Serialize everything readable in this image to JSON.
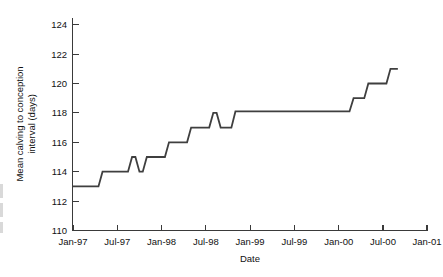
{
  "chart_data": {
    "type": "line",
    "title": "",
    "xlabel": "Date",
    "ylabel": "Mean calving to conception interval (days)",
    "ylabel_line1": "Mean calving to conception",
    "ylabel_line2": "interval (days)",
    "ylim": [
      110,
      124
    ],
    "yticks": [
      110,
      112,
      114,
      116,
      118,
      120,
      122,
      124
    ],
    "ytick_labels": [
      "110",
      "112",
      "114",
      "116",
      "118",
      "120",
      "122",
      "124"
    ],
    "xlim": [
      "Jan-97",
      "Jan-01"
    ],
    "xticks": [
      "Jan-97",
      "Jul-97",
      "Jan-98",
      "Jul-98",
      "Jan-99",
      "Jul-99",
      "Jan-00",
      "Jul-00",
      "Jan-01"
    ],
    "xtick_labels": [
      "Jan-97",
      "Jul-97",
      "Jan-98",
      "Jul-98",
      "Jan-99",
      "Jul-99",
      "Jan-00",
      "Jul-00",
      "Jan-01"
    ],
    "grid": false,
    "legend": null,
    "series": [
      {
        "name": "Mean calving to conception interval",
        "color": "#3f3f3f",
        "x": [
          "Jan-97",
          "Feb-97",
          "Mar-97",
          "Apr-97",
          "May-97",
          "Jun-97",
          "Jul-97",
          "Aug-97",
          "Sep-97",
          "Oct-97",
          "Nov-97",
          "Dec-97",
          "Jan-98",
          "Feb-98",
          "Mar-98",
          "Apr-98",
          "May-98",
          "Jun-98",
          "Jul-98",
          "Aug-98",
          "Sep-98",
          "Oct-98",
          "Nov-98",
          "Dec-98",
          "Jan-99",
          "Jul-99",
          "Jan-00",
          "Mar-00",
          "May-00",
          "Jul-00",
          "Aug-00",
          "Sep-00"
        ],
        "values": [
          113.0,
          113.0,
          113.0,
          113.0,
          114.0,
          114.0,
          114.0,
          114.0,
          115.0,
          114.0,
          115.0,
          115.0,
          115.0,
          116.0,
          116.0,
          116.0,
          117.0,
          117.0,
          117.0,
          118.0,
          117.0,
          117.0,
          118.1,
          118.1,
          118.1,
          118.1,
          118.1,
          119.0,
          120.0,
          120.0,
          121.0,
          121.0
        ]
      }
    ]
  }
}
